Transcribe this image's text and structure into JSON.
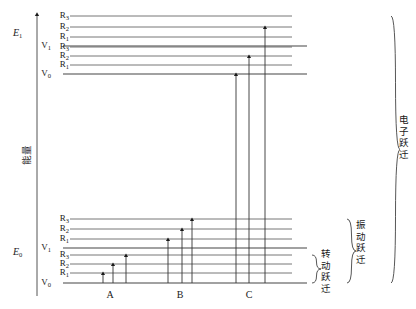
{
  "figure": {
    "type": "energy-level-diagram",
    "axis": {
      "label": "能量",
      "direction": "up",
      "x": 37,
      "y_top": 14,
      "y_bottom": 296
    },
    "electronic_states": [
      {
        "id": "E1",
        "label": "E",
        "sub": "1",
        "label_x": 13,
        "label_y": 36,
        "vib_levels": [
          {
            "label": "V",
            "sub": "1",
            "label_x": 45,
            "label_y": 48,
            "y": 46,
            "x1": 63,
            "x2": 307,
            "rot_levels": [
              {
                "label": "R",
                "sub": "1",
                "y": 37,
                "x1": 70,
                "x2": 292,
                "label_x": 63,
                "label_y": 39
              },
              {
                "label": "R",
                "sub": "2",
                "y": 27,
                "x1": 70,
                "x2": 292,
                "label_x": 63,
                "label_y": 29
              },
              {
                "label": "R",
                "sub": "3",
                "y": 16,
                "x1": 70,
                "x2": 292,
                "label_x": 63,
                "label_y": 18
              }
            ]
          },
          {
            "label": "V",
            "sub": "0",
            "label_x": 45,
            "label_y": 76,
            "y": 74,
            "x1": 63,
            "x2": 307,
            "rot_levels": [
              {
                "label": "R",
                "sub": "1",
                "y": 65,
                "x1": 70,
                "x2": 292,
                "label_x": 63,
                "label_y": 67
              },
              {
                "label": "R",
                "sub": "2",
                "y": 56,
                "x1": 70,
                "x2": 292,
                "label_x": 63,
                "label_y": 58
              },
              {
                "label": "R",
                "sub": "3",
                "y": 47,
                "x1": 70,
                "x2": 292,
                "label_x": 63,
                "label_y": 49
              }
            ]
          }
        ]
      },
      {
        "id": "E0",
        "label": "E",
        "sub": "0",
        "label_x": 13,
        "label_y": 255,
        "vib_levels": [
          {
            "label": "V",
            "sub": "1",
            "label_x": 45,
            "label_y": 250,
            "y": 248,
            "x1": 63,
            "x2": 307,
            "rot_levels": [
              {
                "label": "R",
                "sub": "1",
                "y": 239,
                "x1": 70,
                "x2": 292,
                "label_x": 63,
                "label_y": 241
              },
              {
                "label": "R",
                "sub": "2",
                "y": 229,
                "x1": 70,
                "x2": 292,
                "label_x": 63,
                "label_y": 231
              },
              {
                "label": "R",
                "sub": "3",
                "y": 219,
                "x1": 70,
                "x2": 292,
                "label_x": 63,
                "label_y": 221
              }
            ]
          },
          {
            "label": "V",
            "sub": "0",
            "label_x": 45,
            "label_y": 285,
            "y": 283,
            "x1": 63,
            "x2": 307,
            "rot_levels": [
              {
                "label": "R",
                "sub": "1",
                "y": 273,
                "x1": 70,
                "x2": 292,
                "label_x": 63,
                "label_y": 275
              },
              {
                "label": "R",
                "sub": "2",
                "y": 264,
                "x1": 70,
                "x2": 292,
                "label_x": 63,
                "label_y": 266
              },
              {
                "label": "R",
                "sub": "3",
                "y": 255,
                "x1": 70,
                "x2": 292,
                "label_x": 63,
                "label_y": 257
              }
            ]
          }
        ]
      }
    ],
    "transition_groups": [
      {
        "id": "A",
        "label": "A",
        "label_x": 110,
        "label_y": 298,
        "description": "rotational transitions within V0 of E0",
        "arrows": [
          {
            "x": 103,
            "y_from": 283,
            "y_to": 273
          },
          {
            "x": 113,
            "y_from": 283,
            "y_to": 264
          },
          {
            "x": 126,
            "y_from": 283,
            "y_to": 255
          }
        ]
      },
      {
        "id": "B",
        "label": "B",
        "label_x": 180,
        "label_y": 298,
        "description": "vibrational transitions V0 to V1 of E0",
        "arrows": [
          {
            "x": 168,
            "y_from": 283,
            "y_to": 239
          },
          {
            "x": 182,
            "y_from": 283,
            "y_to": 229
          },
          {
            "x": 192,
            "y_from": 283,
            "y_to": 219
          }
        ]
      },
      {
        "id": "C",
        "label": "C",
        "label_x": 249,
        "label_y": 298,
        "description": "electronic transitions E0 to E1",
        "arrows": [
          {
            "x": 236,
            "y_from": 283,
            "y_to": 74
          },
          {
            "x": 249,
            "y_from": 283,
            "y_to": 56
          },
          {
            "x": 265,
            "y_from": 283,
            "y_to": 27
          }
        ]
      }
    ],
    "braces": [
      {
        "id": "rotational",
        "label": "转动跃迁",
        "x": 312,
        "y_top": 255,
        "y_bottom": 283,
        "label_x": 326,
        "label_y": 257
      },
      {
        "id": "vibrational",
        "label": "振动跃迁",
        "x": 347,
        "y_top": 219,
        "y_bottom": 283,
        "label_x": 361,
        "label_y": 228
      },
      {
        "id": "electronic",
        "label": "电子跃迁",
        "x": 391,
        "y_top": 16,
        "y_bottom": 283,
        "label_x": 404,
        "label_y": 123
      }
    ]
  }
}
